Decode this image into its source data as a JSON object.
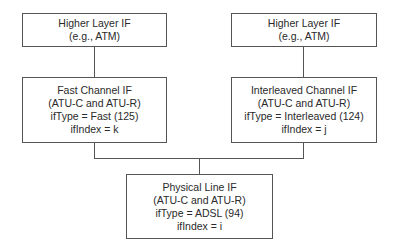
{
  "diagram": {
    "nodes": {
      "higher_left": {
        "lines": [
          "Higher Layer IF",
          "(e.g., ATM)"
        ]
      },
      "higher_right": {
        "lines": [
          "Higher Layer IF",
          "(e.g., ATM)"
        ]
      },
      "fast": {
        "lines": [
          "Fast Channel IF",
          "(ATU-C and ATU-R)",
          "ifType = Fast (125)",
          "ifIndex = k"
        ]
      },
      "interleaved": {
        "lines": [
          "Interleaved Channel IF",
          "(ATU-C and ATU-R)",
          "ifType = Interleaved (124)",
          "ifIndex = j"
        ]
      },
      "physical": {
        "lines": [
          "Physical Line IF",
          "(ATU-C and ATU-R)",
          "ifType = ADSL (94)",
          "ifIndex = i"
        ]
      }
    },
    "edges": [
      {
        "from": "higher_left",
        "to": "fast"
      },
      {
        "from": "higher_right",
        "to": "interleaved"
      },
      {
        "from": "fast",
        "to": "physical"
      },
      {
        "from": "interleaved",
        "to": "physical"
      }
    ],
    "colors": {
      "line": "#555555",
      "text": "#2a2a2a",
      "background": "#ffffff"
    }
  }
}
